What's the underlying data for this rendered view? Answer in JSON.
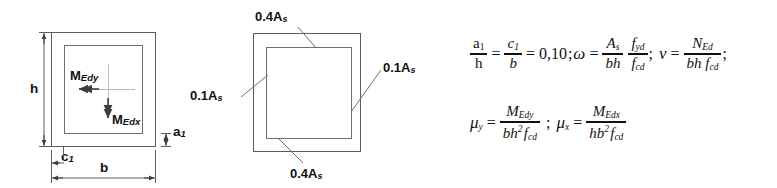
{
  "figure": {
    "background_color": "#ffffff",
    "line_color": "#585d61"
  },
  "left_section": {
    "name": "rectangular-column-cross-section-with-moments",
    "dimensions": {
      "height_label": "h",
      "width_label": "b",
      "cover_label": "c",
      "cover_sub": "1",
      "edge_distance_label": "a",
      "edge_distance_sub": "1"
    },
    "moments": [
      {
        "label": "M",
        "sub": "Edy",
        "direction": "horizontal-left"
      },
      {
        "label": "M",
        "sub": "Edx",
        "direction": "vertical-down"
      }
    ]
  },
  "middle_section": {
    "name": "reinforcement-distribution-cross-section",
    "labels": [
      {
        "id": "top",
        "text": "0.4A",
        "sub": "s"
      },
      {
        "id": "left",
        "text": "0.1A",
        "sub": "s"
      },
      {
        "id": "right",
        "text": "0.1A",
        "sub": "s"
      },
      {
        "id": "bottom",
        "text": "0.4A",
        "sub": "s"
      }
    ]
  },
  "formulas": {
    "line1": {
      "ratio_a_num": "a",
      "ratio_a_sub": "1",
      "ratio_a_den": "h",
      "eq1": "=",
      "ratio_c_num": "c",
      "ratio_c_sub": "1",
      "ratio_c_den": "b",
      "eq2": "=",
      "value": "0,10",
      "semicolon1": ";",
      "omega": "ω",
      "eq3": "=",
      "omega_f1_num": "A",
      "omega_f1_num_sub": "s",
      "omega_f1_den": "bh",
      "omega_f2_num": "f",
      "omega_f2_num_sub": "yd",
      "omega_f2_den": "f",
      "omega_f2_den_sub": "cd",
      "semicolon2": ";",
      "nu": "ν",
      "eq4": "=",
      "nu_num": "N",
      "nu_num_sub": "Ed",
      "nu_den": "bh f",
      "nu_den_sub": "cd",
      "semicolon3": ";"
    },
    "line2": {
      "mu_y": "μ",
      "mu_y_sub": "y",
      "eq1": "=",
      "muy_num": "M",
      "muy_num_sub": "Edy",
      "muy_den": "bh",
      "muy_den_exp": "2",
      "muy_den_f": "f",
      "muy_den_f_sub": "cd",
      "semicolon": ";",
      "mu_x": "μ",
      "mu_x_sub": "x",
      "eq2": "=",
      "mux_num": "M",
      "mux_num_sub": "Edx",
      "mux_den": "hb",
      "mux_den_exp": "2",
      "mux_den_f": "f",
      "mux_den_f_sub": "cd"
    }
  }
}
